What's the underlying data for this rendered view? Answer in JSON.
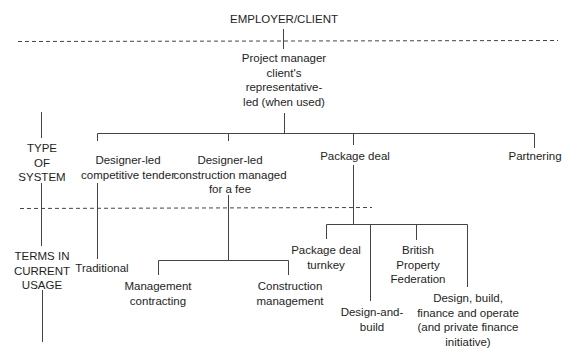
{
  "diagram": {
    "top_node": "EMPLOYER/CLIENT",
    "project_manager": "Project manager\nclient's\nrepresentative-\nled (when used)",
    "side_labels": {
      "type_of_system": "TYPE\nOF\nSYSTEM",
      "terms_in_usage": "TERMS IN\nCURRENT\nUSAGE"
    },
    "systems": [
      {
        "label": "Designer-led\ncompetitive tender"
      },
      {
        "label": "Designer-led\nconstruction managed\nfor a fee"
      },
      {
        "label": "Package deal"
      },
      {
        "label": "Partnering"
      }
    ],
    "terms": {
      "traditional": "Traditional",
      "management_contracting": "Management\ncontracting",
      "construction_management": "Construction\nmanagement",
      "package_deal_turnkey": "Package deal\nturnkey",
      "design_and_build": "Design-and-\nbuild",
      "british_property_federation": "British\nProperty\nFederation",
      "dbfo": "Design, build,\nfinance and operate\n(and private finance\ninitiative)"
    }
  }
}
